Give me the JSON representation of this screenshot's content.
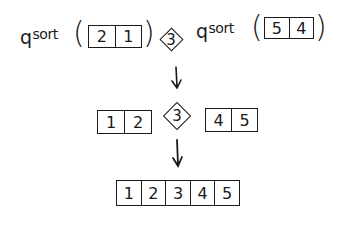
{
  "diagram": {
    "row1": {
      "left_call": {
        "fn_q": "q",
        "fn_rest": "sort",
        "open": "(",
        "close": ")",
        "values": [
          "2",
          "1"
        ]
      },
      "pivot": "3",
      "right_call": {
        "fn_q": "q",
        "fn_rest": "sort",
        "open": "(",
        "close": ")",
        "values": [
          "5",
          "4"
        ]
      }
    },
    "row2": {
      "left": [
        "1",
        "2"
      ],
      "pivot": "3",
      "right": [
        "4",
        "5"
      ]
    },
    "row3": {
      "result": [
        "1",
        "2",
        "3",
        "4",
        "5"
      ]
    },
    "arrows": [
      "down-arrow",
      "down-arrow"
    ],
    "colors": {
      "ink": "#1a1a1a",
      "background": "#ffffff"
    }
  }
}
